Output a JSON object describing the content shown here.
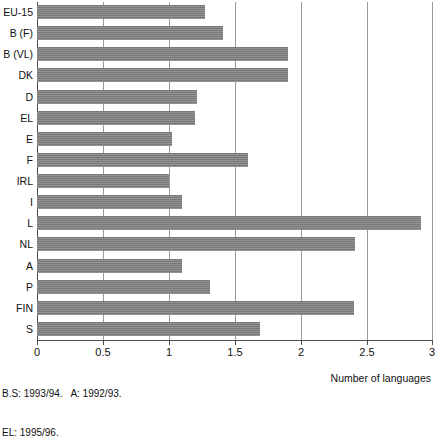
{
  "chart_data": {
    "type": "bar",
    "orientation": "horizontal",
    "title": "",
    "subtitle": "",
    "xlabel": "Number of languages",
    "ylabel": "",
    "xlim": [
      0,
      3
    ],
    "ylim": null,
    "grid": true,
    "legend": null,
    "legend_position": "none",
    "xticks": [
      "0",
      "0.5",
      "1",
      "1.5",
      "2",
      "2.5",
      "3"
    ],
    "xtick_values": [
      0,
      0.5,
      1,
      1.5,
      2,
      2.5,
      3
    ],
    "categories": [
      "EU-15",
      "B (F)",
      "B (VL)",
      "DK",
      "D",
      "EL",
      "E",
      "F",
      "IRL",
      "I",
      "L",
      "NL",
      "A",
      "P",
      "FIN",
      "S"
    ],
    "values": [
      1.27,
      1.41,
      1.9,
      1.9,
      1.21,
      1.2,
      1.02,
      1.6,
      1.0,
      1.1,
      2.91,
      2.41,
      1.1,
      1.31,
      2.4,
      1.69
    ],
    "series": [
      {
        "name": "Number of languages",
        "values": [
          1.27,
          1.41,
          1.9,
          1.9,
          1.21,
          1.2,
          1.02,
          1.6,
          1.0,
          1.1,
          2.91,
          2.41,
          1.1,
          1.31,
          2.4,
          1.69
        ]
      }
    ],
    "annotations": [
      "B.S: 1993/94.   A: 1992/93.",
      "EL: 1995/96."
    ],
    "bar_color": "#7f7f7f",
    "grid_color": "#9a9a9a",
    "axis_color": "#4d4d4d"
  },
  "footnotes": {
    "line1": "B.S: 1993/94.   A: 1992/93.",
    "line2": "EL: 1995/96."
  },
  "axis": {
    "x_title": "Number of languages"
  }
}
